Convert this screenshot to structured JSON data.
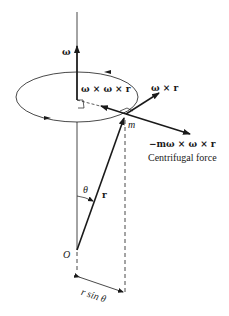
{
  "diagram": {
    "labels": {
      "omega": "ω",
      "omega_cross_omega_cross_r": "ω × ω × r",
      "omega_cross_r": "ω × r",
      "mass": "m",
      "centrifugal_expr": "−mω × ω × r",
      "centrifugal_caption": "Centrifugal force",
      "theta": "θ",
      "r": "r",
      "origin": "O",
      "r_sin_theta": "r sin θ"
    },
    "colors": {
      "stroke": "#1a1a1a",
      "background": "#ffffff"
    }
  }
}
